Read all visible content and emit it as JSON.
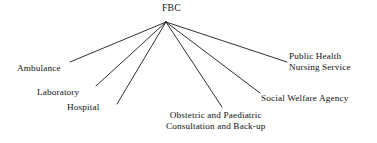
{
  "diagram": {
    "type": "hub-and-spoke",
    "title": "FBC",
    "background_color": "#ffffff",
    "line_color": "#1a1a1a",
    "text_color": "#111111",
    "hub": {
      "label": "FBC",
      "label_x": 162,
      "label_y": 2,
      "apex_x": 166,
      "apex_y": 22
    },
    "spokes": [
      {
        "id": "ambulance",
        "label": "Ambulance",
        "lines": [
          "Ambulance"
        ],
        "end_x": 70,
        "end_y": 62,
        "label_x": 17,
        "label_y": 63,
        "align": "left"
      },
      {
        "id": "laboratory",
        "label": "Laboratory",
        "lines": [
          "Laboratory"
        ],
        "end_x": 96,
        "end_y": 86,
        "label_x": 37,
        "label_y": 87,
        "align": "left"
      },
      {
        "id": "hospital",
        "label": "Hospital",
        "lines": [
          "Hospital"
        ],
        "end_x": 117,
        "end_y": 104,
        "label_x": 67,
        "label_y": 102,
        "align": "left"
      },
      {
        "id": "obstetric-paediatric",
        "label": "Obstetric and Paediatric Consultation and Back-up",
        "lines": [
          "Obstetric and Paediatric",
          "Consultation and Back-up"
        ],
        "end_x": 222,
        "end_y": 107,
        "label_x": 166,
        "label_y": 110,
        "align": "center"
      },
      {
        "id": "social-welfare-agency",
        "label": "Social Welfare Agency",
        "lines": [
          "Social Welfare Agency"
        ],
        "end_x": 260,
        "end_y": 93,
        "label_x": 261,
        "label_y": 93,
        "align": "left"
      },
      {
        "id": "public-health-nursing-service",
        "label": "Public Health Nursing Service",
        "lines": [
          "Public Health",
          "Nursing Service"
        ],
        "end_x": 287,
        "end_y": 62,
        "label_x": 289,
        "label_y": 51,
        "align": "left"
      }
    ]
  }
}
